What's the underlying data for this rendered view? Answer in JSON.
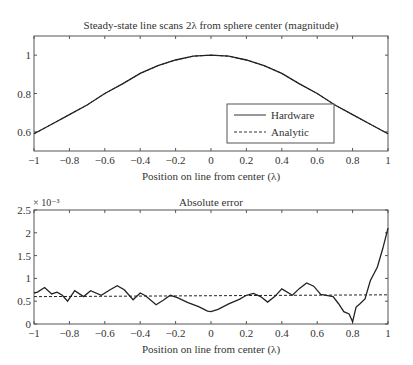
{
  "chart_data": [
    {
      "type": "line",
      "title": "Steady-state line scans 2λ from sphere center (magnitude)",
      "xlabel": "Position on line from center (λ)",
      "ylabel": "",
      "xlim": [
        -1,
        1
      ],
      "ylim": [
        0.5,
        1.1
      ],
      "xticks": [
        "−1",
        "−0.8",
        "−0.6",
        "−0.4",
        "−0.2",
        "0",
        "0.2",
        "0.4",
        "0.6",
        "0.8",
        "1"
      ],
      "yticks": [
        "0.6",
        "0.8",
        "1"
      ],
      "grid": false,
      "legend_position": "lower right",
      "x": [
        -1,
        -0.9,
        -0.8,
        -0.7,
        -0.6,
        -0.5,
        -0.4,
        -0.3,
        -0.2,
        -0.1,
        0,
        0.1,
        0.2,
        0.3,
        0.4,
        0.5,
        0.6,
        0.7,
        0.8,
        0.9,
        1
      ],
      "series": [
        {
          "name": "Hardware",
          "style": "solid",
          "values": [
            0.59,
            0.64,
            0.69,
            0.74,
            0.8,
            0.85,
            0.905,
            0.945,
            0.975,
            0.995,
            1.0,
            0.995,
            0.975,
            0.945,
            0.905,
            0.85,
            0.8,
            0.74,
            0.69,
            0.64,
            0.59
          ]
        },
        {
          "name": "Analytic",
          "style": "dashed",
          "values": [
            0.59,
            0.64,
            0.69,
            0.74,
            0.8,
            0.85,
            0.905,
            0.945,
            0.975,
            0.995,
            1.0,
            0.995,
            0.975,
            0.945,
            0.905,
            0.85,
            0.8,
            0.74,
            0.69,
            0.64,
            0.59
          ]
        }
      ]
    },
    {
      "type": "line",
      "title": "Absolute error",
      "xlabel": "Position on line from center (λ)",
      "ylabel": "",
      "y_multiplier": "× 10⁻³",
      "xlim": [
        -1,
        1
      ],
      "ylim": [
        0,
        2.5
      ],
      "xticks": [
        "−1",
        "−0.8",
        "−0.6",
        "−0.4",
        "−0.2",
        "0",
        "0.2",
        "0.4",
        "0.6",
        "0.8",
        "1"
      ],
      "yticks": [
        "0",
        "0.5",
        "1",
        "1.5",
        "2",
        "2.5"
      ],
      "grid": false,
      "x": [
        -1,
        -0.98,
        -0.94,
        -0.9,
        -0.87,
        -0.84,
        -0.81,
        -0.77,
        -0.72,
        -0.68,
        -0.62,
        -0.57,
        -0.53,
        -0.49,
        -0.44,
        -0.4,
        -0.37,
        -0.31,
        -0.27,
        -0.23,
        -0.19,
        -0.13,
        -0.07,
        -0.02,
        0,
        0.04,
        0.1,
        0.16,
        0.2,
        0.24,
        0.28,
        0.32,
        0.36,
        0.4,
        0.46,
        0.5,
        0.54,
        0.58,
        0.62,
        0.66,
        0.69,
        0.72,
        0.75,
        0.78,
        0.8,
        0.82,
        0.84,
        0.87,
        0.9,
        0.94,
        0.97,
        1.0
      ],
      "series": [
        {
          "name": "Error",
          "style": "solid",
          "values": [
            0.68,
            0.7,
            0.8,
            0.66,
            0.7,
            0.63,
            0.5,
            0.73,
            0.6,
            0.73,
            0.63,
            0.75,
            0.84,
            0.75,
            0.53,
            0.68,
            0.62,
            0.42,
            0.52,
            0.63,
            0.58,
            0.47,
            0.38,
            0.28,
            0.27,
            0.32,
            0.44,
            0.54,
            0.63,
            0.67,
            0.6,
            0.48,
            0.6,
            0.77,
            0.63,
            0.78,
            0.9,
            0.83,
            0.65,
            0.62,
            0.6,
            0.45,
            0.27,
            0.22,
            0.05,
            0.37,
            0.44,
            0.55,
            0.95,
            1.25,
            1.65,
            2.1
          ]
        },
        {
          "name": "Reference",
          "style": "dashed",
          "values_endpoints": [
            0.6,
            0.64
          ]
        }
      ]
    }
  ],
  "legend": {
    "items": [
      {
        "label": "Hardware"
      },
      {
        "label": "Analytic"
      }
    ]
  },
  "plot1": {
    "title": "Steady-state line scans 2λ from sphere center (magnitude)",
    "xlabel": "Position on line from center (λ)"
  },
  "plot2": {
    "title": "Absolute error",
    "xlabel": "Position on line from center (λ)",
    "multiplier": "× 10⁻³"
  }
}
